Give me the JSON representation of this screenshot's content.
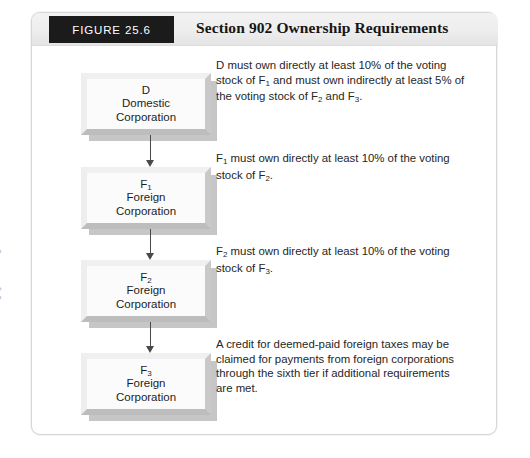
{
  "figure": {
    "tab_label": "FIGURE 25.6",
    "title": "Section 902 Ownership Requirements"
  },
  "credit": "© Cengage Learning 2014",
  "nodes": [
    {
      "id": "domestic-corporation",
      "label_main": "D",
      "label_sub": "",
      "line2": "Domestic",
      "line3": "Corporation"
    },
    {
      "id": "foreign-corporation-1",
      "label_main": "F",
      "label_sub": "1",
      "line2": "Foreign",
      "line3": "Corporation"
    },
    {
      "id": "foreign-corporation-2",
      "label_main": "F",
      "label_sub": "2",
      "line2": "Foreign",
      "line3": "Corporation"
    },
    {
      "id": "foreign-corporation-3",
      "label_main": "F",
      "label_sub": "3",
      "line2": "Foreign",
      "line3": "Corporation"
    }
  ],
  "notes": [
    {
      "id": "note-domestic",
      "html": "D must own directly at least 10% of the voting stock of F<sub>1</sub> and must own indirectly at least 5% of the voting stock of F<sub>2</sub> and F<sub>3</sub>.",
      "text": "D must own directly at least 10% of the voting stock of F1 and must own indirectly at least 5% of the voting stock of F2 and F3."
    },
    {
      "id": "note-f1",
      "html": "F<sub>1</sub> must own directly at least 10% of the voting stock of F<sub>2</sub>.",
      "text": "F1 must own directly at least 10% of the voting stock of F2."
    },
    {
      "id": "note-f2",
      "html": "F<sub>2</sub> must own directly at least 10% of the voting stock of F<sub>3</sub>.",
      "text": "F2 must own directly at least 10% of the voting stock of F3."
    },
    {
      "id": "note-credit",
      "html": "A credit for deemed-paid foreign taxes may be claimed for payments from foreign corporations through the sixth tier if additional requirements are met.",
      "text": "A credit for deemed-paid foreign taxes may be claimed for payments from foreign corporations through the sixth tier if additional requirements are met."
    }
  ],
  "colors": {
    "tab_background": "#1b1b1b",
    "tab_text": "#ffffff",
    "header_background": "#eeeeee",
    "title_text": "#161616",
    "box_face": "#fbfbfb",
    "box_shadow": "#b4b4b4",
    "arrow": "#4a4a4a",
    "body_text": "#262626",
    "frame_border": "#d7d7d7",
    "credit_text": "#9a9a9a"
  },
  "layout": {
    "node_tops": [
      27,
      121,
      214,
      307
    ],
    "note_tops": [
      12,
      105,
      198,
      291
    ],
    "connector_tops": [
      89,
      183,
      276
    ],
    "connector_heights": [
      32,
      31,
      31
    ]
  }
}
